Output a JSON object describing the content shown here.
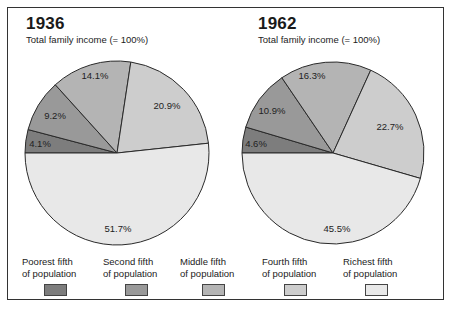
{
  "charts": [
    {
      "year": "1936",
      "subtitle": "Total family income (= 100%)",
      "labels": [
        "4.1%",
        "9.2%",
        "14.1%",
        "20.9%",
        "51.7%"
      ]
    },
    {
      "year": "1962",
      "subtitle": "Total family income (= 100%)",
      "labels": [
        "4.6%",
        "10.9%",
        "16.3%",
        "22.7%",
        "45.5%"
      ]
    }
  ],
  "legend": [
    {
      "line1": "Poorest fifth",
      "line2": "of population",
      "color": "#7d7d7d"
    },
    {
      "line1": "Second fifth",
      "line2": "of population",
      "color": "#999999"
    },
    {
      "line1": "Middle fifth",
      "line2": "of population",
      "color": "#b4b4b4"
    },
    {
      "line1": "Fourth fifth",
      "line2": "of population",
      "color": "#cdcdcd"
    },
    {
      "line1": "Richest fifth",
      "line2": "of population",
      "color": "#e8e8e8"
    }
  ],
  "chart_data": [
    {
      "type": "pie",
      "title": "1936",
      "subtitle": "Total family income (= 100%)",
      "categories": [
        "Poorest fifth of population",
        "Second fifth of population",
        "Middle fifth of population",
        "Fourth fifth of population",
        "Richest fifth of population"
      ],
      "values": [
        4.1,
        9.2,
        14.1,
        20.9,
        51.7
      ],
      "colors": [
        "#7d7d7d",
        "#999999",
        "#b4b4b4",
        "#cdcdcd",
        "#e8e8e8"
      ],
      "legend_position": "bottom"
    },
    {
      "type": "pie",
      "title": "1962",
      "subtitle": "Total family income (= 100%)",
      "categories": [
        "Poorest fifth of population",
        "Second fifth of population",
        "Middle fifth of population",
        "Fourth fifth of population",
        "Richest fifth of population"
      ],
      "values": [
        4.6,
        10.9,
        16.3,
        22.7,
        45.5
      ],
      "colors": [
        "#7d7d7d",
        "#999999",
        "#b4b4b4",
        "#cdcdcd",
        "#e8e8e8"
      ],
      "legend_position": "bottom"
    }
  ]
}
